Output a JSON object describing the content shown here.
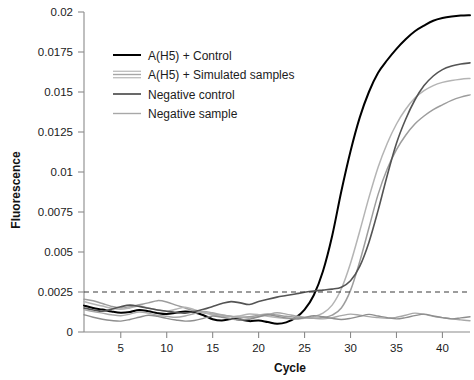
{
  "chart_data": {
    "type": "line",
    "title": "",
    "xlabel": "Cycle",
    "ylabel": "Fluorescence",
    "xlim": [
      1,
      43
    ],
    "ylim": [
      0,
      0.02
    ],
    "xticks": [
      5,
      10,
      15,
      20,
      25,
      30,
      35,
      40
    ],
    "xtick_labels": [
      "5",
      "10",
      "15",
      "20",
      "25",
      "30",
      "35",
      "40"
    ],
    "yticks": [
      0,
      0.0025,
      0.005,
      0.0075,
      0.01,
      0.0125,
      0.015,
      0.0175,
      0.02
    ],
    "ytick_labels": [
      "0",
      "0.0025",
      "0.005",
      "0.0075",
      "0.01",
      "0.0125",
      "0.015",
      "0.0175",
      "0.02"
    ],
    "grid": false,
    "legend_position": "upper-left-inside",
    "threshold": {
      "value": 0.0025,
      "style": "dashed",
      "color": "#3a3a3a",
      "label": ""
    },
    "x": [
      1,
      2,
      3,
      4,
      5,
      6,
      7,
      8,
      9,
      10,
      11,
      12,
      13,
      14,
      15,
      16,
      17,
      18,
      19,
      20,
      21,
      22,
      23,
      24,
      25,
      26,
      27,
      28,
      29,
      30,
      31,
      32,
      33,
      34,
      35,
      36,
      37,
      38,
      39,
      40,
      41,
      42,
      43
    ],
    "series": [
      {
        "name": "A(H5) + Control",
        "color": "#000000",
        "width": 2.0,
        "values": [
          0.00165,
          0.0015,
          0.0014,
          0.00128,
          0.0012,
          0.00125,
          0.00138,
          0.0013,
          0.00118,
          0.00112,
          0.0012,
          0.00128,
          0.00122,
          0.00105,
          0.0008,
          0.00072,
          0.00082,
          0.00078,
          0.00068,
          0.00072,
          0.00062,
          0.00052,
          0.0006,
          0.00088,
          0.0014,
          0.0023,
          0.0038,
          0.006,
          0.0088,
          0.0113,
          0.0134,
          0.015,
          0.0162,
          0.017,
          0.0177,
          0.0183,
          0.0188,
          0.01915,
          0.01945,
          0.01962,
          0.01972,
          0.01978,
          0.0198
        ]
      },
      {
        "name": "A(H5) + Simulated samples",
        "color": "#9d9d9d",
        "width": 1.5,
        "values": [
          0.00205,
          0.00195,
          0.00178,
          0.0016,
          0.0015,
          0.00158,
          0.0017,
          0.00182,
          0.00196,
          0.00188,
          0.00168,
          0.0015,
          0.00132,
          0.0012,
          0.00112,
          0.00105,
          0.00098,
          0.00092,
          0.00095,
          0.00105,
          0.00112,
          0.00106,
          0.00098,
          0.00092,
          0.00088,
          0.00086,
          0.0009,
          0.00105,
          0.0015,
          0.0026,
          0.0044,
          0.0065,
          0.0086,
          0.0102,
          0.0114,
          0.0123,
          0.013,
          0.0135,
          0.0139,
          0.0142,
          0.01448,
          0.01468,
          0.01482
        ]
      },
      {
        "name": "A(H5) + Simulated samples",
        "color": "#b4b4b4",
        "width": 1.5,
        "values": [
          0.0019,
          0.00175,
          0.00162,
          0.00148,
          0.00142,
          0.0015,
          0.00162,
          0.0015,
          0.00138,
          0.0013,
          0.00142,
          0.00155,
          0.0014,
          0.00122,
          0.00108,
          0.001,
          0.00095,
          0.00102,
          0.00112,
          0.00108,
          0.00098,
          0.0009,
          0.00085,
          0.00082,
          0.00086,
          0.00095,
          0.00118,
          0.00168,
          0.0027,
          0.0043,
          0.0063,
          0.0084,
          0.0103,
          0.0118,
          0.013,
          0.01392,
          0.01462,
          0.01508,
          0.0154,
          0.0156,
          0.01572,
          0.0158,
          0.01585
        ]
      },
      {
        "name": "Negative control",
        "color": "#545454",
        "width": 1.6,
        "values": [
          0.0015,
          0.00138,
          0.0013,
          0.00142,
          0.00158,
          0.00168,
          0.0016,
          0.00148,
          0.00138,
          0.0013,
          0.00122,
          0.00118,
          0.00128,
          0.00142,
          0.0016,
          0.00178,
          0.0019,
          0.00182,
          0.00172,
          0.0019,
          0.00205,
          0.00218,
          0.00228,
          0.00238,
          0.00248,
          0.00256,
          0.00262,
          0.00268,
          0.0028,
          0.0032,
          0.0041,
          0.0056,
          0.0076,
          0.0098,
          0.0118,
          0.0133,
          0.0145,
          0.0154,
          0.016,
          0.0164,
          0.01662,
          0.01675,
          0.01682
        ]
      },
      {
        "name": "Negative sample",
        "color": "#a8a8a8",
        "width": 1.4,
        "values": [
          0.0014,
          0.00128,
          0.00118,
          0.00108,
          0.00102,
          0.00112,
          0.00125,
          0.00118,
          0.00105,
          0.00098,
          0.00092,
          0.001,
          0.00115,
          0.00128,
          0.0012,
          0.00108,
          0.00098,
          0.00092,
          0.00088,
          0.00095,
          0.00108,
          0.0012,
          0.00112,
          0.001,
          0.00092,
          0.00086,
          0.00082,
          0.0009,
          0.00102,
          0.00112,
          0.00105,
          0.00096,
          0.0009,
          0.00085,
          0.00092,
          0.00105,
          0.00118,
          0.0011,
          0.00098,
          0.0009,
          0.00082,
          0.00076,
          0.0007
        ]
      },
      {
        "name": "Negative sample",
        "color": "#8e8e8e",
        "width": 1.4,
        "values": [
          0.00108,
          0.00092,
          0.0008,
          0.00072,
          0.00068,
          0.00078,
          0.00092,
          0.00105,
          0.00098,
          0.00085,
          0.00075,
          0.00068,
          0.00072,
          0.00085,
          0.001,
          0.00092,
          0.00082,
          0.00075,
          0.0008,
          0.00095,
          0.00108,
          0.00098,
          0.00088,
          0.00082,
          0.0009,
          0.00102,
          0.00095,
          0.00085,
          0.00078,
          0.00085,
          0.00098,
          0.0011,
          0.001,
          0.0009,
          0.00082,
          0.0009,
          0.00102,
          0.00112,
          0.001,
          0.0009,
          0.00082,
          0.00088,
          0.00095
        ]
      }
    ],
    "legend_entries": [
      {
        "label": "A(H5) + Control",
        "color": "#000000",
        "style": "single",
        "width": 2.0
      },
      {
        "label": "A(H5) + Simulated samples",
        "color": "#a6a6a6",
        "style": "multi",
        "width": 1.4
      },
      {
        "label": "Negative control",
        "color": "#4f4f4f",
        "style": "single",
        "width": 1.7
      },
      {
        "label": "Negative sample",
        "color": "#a8a8a8",
        "style": "single",
        "width": 1.4
      }
    ]
  }
}
